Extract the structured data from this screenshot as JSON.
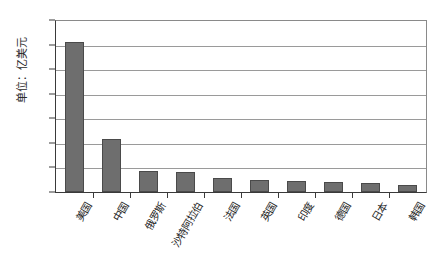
{
  "chart_data": {
    "type": "bar",
    "title": "",
    "xlabel": "",
    "ylabel": "单位：亿美元",
    "ylim": [
      0,
      7000
    ],
    "ytick_values": [
      0,
      1000,
      2000,
      3000,
      4000,
      5000,
      6000,
      7000
    ],
    "ytick_labels": [
      "0",
      "1000",
      "2000",
      "3000",
      "4000",
      "5000",
      "6000",
      "7000"
    ],
    "grid": true,
    "legend": false,
    "bar_color": "#6e6e6e",
    "categories": [
      "美国",
      "中国",
      "俄罗斯",
      "沙特阿拉伯",
      "法国",
      "英国",
      "印度",
      "德国",
      "日本",
      "韩国"
    ],
    "values": [
      6100,
      2170,
      850,
      800,
      580,
      500,
      430,
      400,
      350,
      300
    ]
  }
}
